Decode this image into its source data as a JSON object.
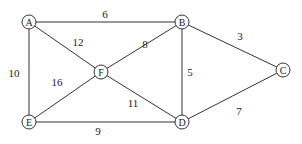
{
  "graph": {
    "type": "weighted-undirected-graph",
    "nodes": [
      {
        "id": "A",
        "label": "A",
        "x": 29,
        "y": 22
      },
      {
        "id": "B",
        "label": "B",
        "x": 182,
        "y": 22
      },
      {
        "id": "C",
        "label": "C",
        "x": 283,
        "y": 70
      },
      {
        "id": "D",
        "label": "D",
        "x": 182,
        "y": 122
      },
      {
        "id": "E",
        "label": "E",
        "x": 29,
        "y": 122
      },
      {
        "id": "F",
        "label": "F",
        "x": 101,
        "y": 72
      }
    ],
    "edges": [
      {
        "from": "A",
        "to": "B",
        "weight": "6",
        "lx": 105,
        "ly": 14
      },
      {
        "from": "A",
        "to": "F",
        "weight": "12",
        "lx": 78,
        "ly": 42
      },
      {
        "from": "A",
        "to": "E",
        "weight": "10",
        "lx": 14,
        "ly": 73
      },
      {
        "from": "B",
        "to": "F",
        "weight": "8",
        "lx": 145,
        "ly": 44
      },
      {
        "from": "B",
        "to": "D",
        "weight": "5",
        "lx": 190,
        "ly": 72
      },
      {
        "from": "B",
        "to": "C",
        "weight": "3",
        "lx": 240,
        "ly": 36
      },
      {
        "from": "C",
        "to": "D",
        "weight": "7",
        "lx": 239,
        "ly": 111
      },
      {
        "from": "F",
        "to": "E",
        "weight": "16",
        "lx": 57,
        "ly": 82
      },
      {
        "from": "F",
        "to": "D",
        "weight": "11",
        "lx": 133,
        "ly": 103
      },
      {
        "from": "E",
        "to": "D",
        "weight": "9",
        "lx": 98,
        "ly": 131
      }
    ]
  }
}
